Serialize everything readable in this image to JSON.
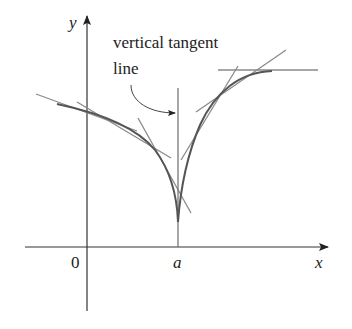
{
  "diagram": {
    "axes": {
      "x_label": "x",
      "y_label": "y",
      "origin_label": "0",
      "point_label": "a"
    },
    "annotation": {
      "line1": "vertical tangent",
      "line2": "line"
    },
    "colors": {
      "axis": "#333333",
      "curve": "#555555",
      "tangent": "#8a8a8a"
    }
  }
}
